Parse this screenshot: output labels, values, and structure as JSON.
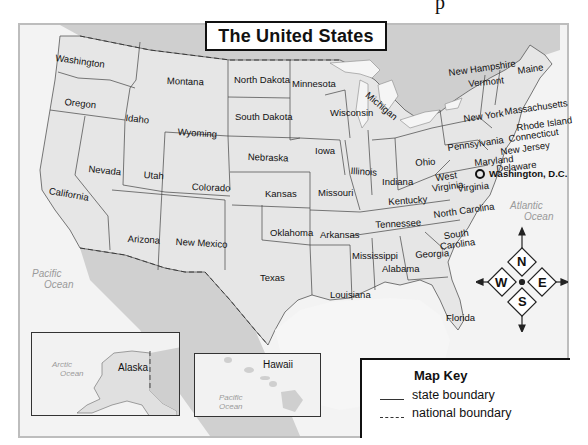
{
  "header": {
    "title": "The United States",
    "cut_off_glyph": "p"
  },
  "states": [
    {
      "name": "Washington",
      "x": 56,
      "y": 53,
      "rot": 8
    },
    {
      "name": "Oregon",
      "x": 65,
      "y": 97,
      "rot": 6
    },
    {
      "name": "California",
      "x": 50,
      "y": 186,
      "rot": 10
    },
    {
      "name": "Nevada",
      "x": 89,
      "y": 164,
      "rot": 6
    },
    {
      "name": "Idaho",
      "x": 126,
      "y": 113,
      "rot": 6
    },
    {
      "name": "Montana",
      "x": 167,
      "y": 76,
      "rot": 2
    },
    {
      "name": "Wyoming",
      "x": 178,
      "y": 127,
      "rot": 4
    },
    {
      "name": "Utah",
      "x": 144,
      "y": 170,
      "rot": 4
    },
    {
      "name": "Colorado",
      "x": 192,
      "y": 182,
      "rot": 2
    },
    {
      "name": "Arizona",
      "x": 128,
      "y": 234,
      "rot": 3
    },
    {
      "name": "New Mexico",
      "x": 176,
      "y": 237,
      "rot": 3
    },
    {
      "name": "North Dakota",
      "x": 234,
      "y": 75,
      "rot": 0
    },
    {
      "name": "South Dakota",
      "x": 235,
      "y": 112,
      "rot": 0
    },
    {
      "name": "Nebraska",
      "x": 248,
      "y": 152,
      "rot": 2
    },
    {
      "name": "Kansas",
      "x": 265,
      "y": 189,
      "rot": 0
    },
    {
      "name": "Oklahoma",
      "x": 270,
      "y": 228,
      "rot": 0
    },
    {
      "name": "Texas",
      "x": 260,
      "y": 273,
      "rot": 0
    },
    {
      "name": "Minnesota",
      "x": 292,
      "y": 79,
      "rot": 0
    },
    {
      "name": "Iowa",
      "x": 315,
      "y": 146,
      "rot": 0
    },
    {
      "name": "Missouri",
      "x": 318,
      "y": 188,
      "rot": 0
    },
    {
      "name": "Arkansas",
      "x": 320,
      "y": 230,
      "rot": 0
    },
    {
      "name": "Louisiana",
      "x": 330,
      "y": 290,
      "rot": 0
    },
    {
      "name": "Wisconsin",
      "x": 330,
      "y": 108,
      "rot": 0
    },
    {
      "name": "Illinois",
      "x": 351,
      "y": 166,
      "rot": 4
    },
    {
      "name": "Michigan",
      "x": 370,
      "y": 90,
      "rot": 40
    },
    {
      "name": "Indiana",
      "x": 382,
      "y": 177,
      "rot": 0
    },
    {
      "name": "Ohio",
      "x": 415,
      "y": 158,
      "rot": -4
    },
    {
      "name": "Kentucky",
      "x": 388,
      "y": 197,
      "rot": -4
    },
    {
      "name": "Tennessee",
      "x": 375,
      "y": 220,
      "rot": -3
    },
    {
      "name": "Mississippi",
      "x": 352,
      "y": 251,
      "rot": 0
    },
    {
      "name": "Alabama",
      "x": 382,
      "y": 264,
      "rot": 0
    },
    {
      "name": "Georgia",
      "x": 415,
      "y": 250,
      "rot": -3
    },
    {
      "name": "Florida",
      "x": 446,
      "y": 313,
      "rot": 0
    },
    {
      "name": "South Carolina",
      "x": 438,
      "y": 232,
      "rot": -8,
      "two_line": [
        "South",
        "Carolina"
      ]
    },
    {
      "name": "North Carolina",
      "x": 433,
      "y": 210,
      "rot": -8
    },
    {
      "name": "Virginia",
      "x": 457,
      "y": 184,
      "rot": -6
    },
    {
      "name": "West Virginia",
      "x": 430,
      "y": 174,
      "rot": -8,
      "two_line": [
        "West",
        "Virginia"
      ]
    },
    {
      "name": "Pennsylvania",
      "x": 447,
      "y": 143,
      "rot": -8
    },
    {
      "name": "Maryland",
      "x": 474,
      "y": 158,
      "rot": -6
    },
    {
      "name": "Delaware",
      "x": 496,
      "y": 164,
      "rot": -6
    },
    {
      "name": "New Jersey",
      "x": 500,
      "y": 147,
      "rot": -8
    },
    {
      "name": "Connecticut",
      "x": 508,
      "y": 134,
      "rot": -8
    },
    {
      "name": "Rhode Island",
      "x": 516,
      "y": 123,
      "rot": -8
    },
    {
      "name": "Massachusetts",
      "x": 504,
      "y": 107,
      "rot": -8
    },
    {
      "name": "New York",
      "x": 463,
      "y": 114,
      "rot": -8
    },
    {
      "name": "Vermont",
      "x": 468,
      "y": 79,
      "rot": -6
    },
    {
      "name": "New Hampshire",
      "x": 448,
      "y": 68,
      "rot": -8
    },
    {
      "name": "Maine",
      "x": 517,
      "y": 66,
      "rot": -8
    }
  ],
  "capital": {
    "name": "Washington, D.C.",
    "x": 485,
    "y": 173
  },
  "oceans": {
    "pacific": [
      "Pacific",
      "Ocean"
    ],
    "atlantic": [
      "Atlantic",
      "Ocean"
    ],
    "arctic_inset": [
      "Arctic",
      "Ocean"
    ],
    "pacific_inset": [
      "Pacific",
      "Ocean"
    ]
  },
  "insets": {
    "alaska": {
      "label": "Alaska"
    },
    "hawaii": {
      "label": "Hawaii"
    }
  },
  "compass": {
    "n": "N",
    "e": "E",
    "s": "S",
    "w": "W"
  },
  "map_key": {
    "title": "Map Key",
    "items": [
      {
        "line": "solid",
        "label": "state boundary"
      },
      {
        "line": "dashed",
        "label": "national boundary"
      }
    ]
  },
  "colors": {
    "land": "#e4e4e4",
    "water": "#f4f4f4",
    "foreign_land": "#cfcfcf",
    "border": "#333333"
  }
}
